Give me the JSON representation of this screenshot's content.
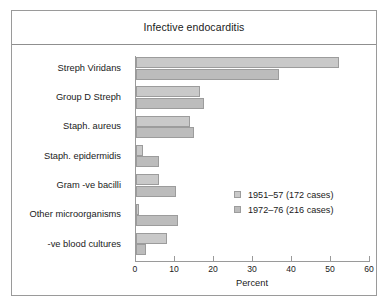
{
  "figure": {
    "frame_border_color": "#9a9a9a",
    "background": "#ffffff"
  },
  "chart_data": {
    "type": "bar",
    "orientation": "horizontal",
    "title": "Infective endocarditis",
    "xlabel": "Percent",
    "ylabel": "",
    "xlim": [
      0,
      60
    ],
    "xticks": [
      0,
      10,
      20,
      30,
      40,
      50,
      60
    ],
    "xtick_labels": [
      "0",
      "10",
      "20",
      "30",
      "40",
      "50",
      "60"
    ],
    "grid": false,
    "legend_position": "center-right",
    "categories": [
      "Streph Viridans",
      "Group D Streph",
      "Staph. aureus",
      "Staph. epidermidis",
      "Gram -ve bacilli",
      "Other microorganisms",
      "-ve blood cultures"
    ],
    "series": [
      {
        "name": "1951–57 (172 cases)",
        "color": "#c9c9c9",
        "values": [
          52.0,
          16.4,
          13.8,
          1.8,
          5.8,
          0.8,
          7.9
        ]
      },
      {
        "name": "1972–76 (216 cases)",
        "color": "#bcbcbc",
        "values": [
          36.7,
          17.4,
          14.9,
          5.8,
          10.3,
          10.8,
          2.6
        ]
      }
    ]
  },
  "legend": {
    "entries": [
      {
        "label": "1951–57 (172 cases)",
        "swatch": "#c9c9c9"
      },
      {
        "label": "1972–76 (216 cases)",
        "swatch": "#bcbcbc"
      }
    ]
  }
}
